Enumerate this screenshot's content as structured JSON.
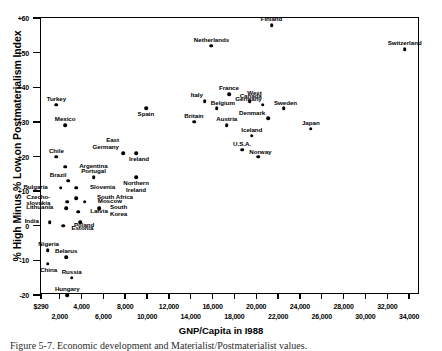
{
  "chart_data": {
    "type": "scatter",
    "title": "",
    "xlabel": "GNP/Capita in I988",
    "ylabel": "% High Minus % Low on Postmaterialism Index",
    "xlim": [
      290,
      35000
    ],
    "ylim": [
      -20,
      60
    ],
    "grid": false,
    "legend": "none",
    "y_ticks": [
      "+60",
      "+50",
      "+40",
      "+30",
      "+20",
      "+10",
      "0",
      "-10",
      "-20"
    ],
    "y_tick_values": [
      60,
      50,
      40,
      30,
      20,
      10,
      0,
      -10,
      -20
    ],
    "x_ticks_upper": [
      "$290",
      "4,000",
      "8,000",
      "12,000",
      "16,000",
      "20,000",
      "24,000",
      "28,000",
      "32,000"
    ],
    "x_ticks_lower": [
      "2,000",
      "6,000",
      "10,000",
      "14,000",
      "18,000",
      "22,000",
      "26,000",
      "30,000",
      "34,000"
    ],
    "x_tick_values_upper": [
      290,
      4000,
      8000,
      12000,
      16000,
      20000,
      24000,
      28000,
      32000
    ],
    "x_tick_values_lower": [
      2000,
      6000,
      10000,
      14000,
      18000,
      22000,
      26000,
      30000,
      34000
    ],
    "points": [
      {
        "label": "Switzerland",
        "x": 33600,
        "y": 51,
        "lx": 0,
        "ly": -9
      },
      {
        "label": "Finland",
        "x": 21400,
        "y": 58,
        "lx": 0,
        "ly": -9
      },
      {
        "label": "Netherlands",
        "x": 15900,
        "y": 52,
        "lx": 0,
        "ly": -9
      },
      {
        "label": "France",
        "x": 17500,
        "y": 38,
        "lx": 0,
        "ly": -9
      },
      {
        "label": "Italy",
        "x": 15300,
        "y": 36,
        "lx": -2,
        "ly": -9
      },
      {
        "label": "Belgium",
        "x": 16400,
        "y": 34,
        "lx": 6,
        "ly": -8
      },
      {
        "label": "Canada",
        "x": 19400,
        "y": 36,
        "lx": 1,
        "ly": -8
      },
      {
        "label": "West\nGermany",
        "x": 20600,
        "y": 35,
        "lx": -1,
        "ly": -15
      },
      {
        "label": "Sweden",
        "x": 22500,
        "y": 34,
        "lx": 2,
        "ly": -8
      },
      {
        "label": "Denmark",
        "x": 21100,
        "y": 31,
        "lx": -3,
        "ly": -8
      },
      {
        "label": "Austria",
        "x": 17300,
        "y": 29,
        "lx": 0,
        "ly": -9
      },
      {
        "label": "Britain",
        "x": 14300,
        "y": 30,
        "lx": 0,
        "ly": -9
      },
      {
        "label": "Spain",
        "x": 9900,
        "y": 34,
        "lx": 0,
        "ly": 3
      },
      {
        "label": "Japan",
        "x": 25000,
        "y": 28,
        "lx": 0,
        "ly": -9
      },
      {
        "label": "Iceland",
        "x": 19600,
        "y": 26,
        "lx": 0,
        "ly": -9
      },
      {
        "label": "U.S.A.",
        "x": 18700,
        "y": 22,
        "lx": 0,
        "ly": -9
      },
      {
        "label": "Norway",
        "x": 20200,
        "y": 20,
        "lx": 2,
        "ly": -8
      },
      {
        "label": "East\nGermany",
        "x": 7800,
        "y": 21,
        "lx": -4,
        "ly": -16
      },
      {
        "label": "Ireland",
        "x": 9000,
        "y": 21,
        "lx": 3,
        "ly": 3
      },
      {
        "label": "Northern\nIreland",
        "x": 9000,
        "y": 14,
        "lx": 0,
        "ly": 3
      },
      {
        "label": "Turkey",
        "x": 1700,
        "y": 35,
        "lx": 0,
        "ly": -9
      },
      {
        "label": "Mexico",
        "x": 2500,
        "y": 29,
        "lx": 0,
        "ly": -9
      },
      {
        "label": "Chile",
        "x": 1700,
        "y": 20,
        "lx": 0,
        "ly": -9
      },
      {
        "label": "Argentina",
        "x": 2500,
        "y": 17,
        "lx": 14,
        "ly": -4
      },
      {
        "label": "Brazil",
        "x": 2800,
        "y": 13,
        "lx": -2,
        "ly": -9
      },
      {
        "label": "Portugal",
        "x": 5100,
        "y": 14,
        "lx": 0,
        "ly": -9
      },
      {
        "label": "Bulgaria",
        "x": 2100,
        "y": 11,
        "lx": -13,
        "ly": -4
      },
      {
        "label": "Slovenia",
        "x": 3500,
        "y": 11,
        "lx": 14,
        "ly": -4
      },
      {
        "label": "South Africa",
        "x": 3500,
        "y": 8,
        "lx": 21,
        "ly": -4
      },
      {
        "label": "Czecho-\nslovakia",
        "x": 2700,
        "y": 7,
        "lx": -17,
        "ly": -8
      },
      {
        "label": "Moscow",
        "x": 4300,
        "y": 7,
        "lx": 13,
        "ly": -4
      },
      {
        "label": "Lithuania",
        "x": 2600,
        "y": 5,
        "lx": -13,
        "ly": -4
      },
      {
        "label": "Latvia",
        "x": 3700,
        "y": 4,
        "lx": 12,
        "ly": -4
      },
      {
        "label": "South\nKorea",
        "x": 5600,
        "y": 5,
        "lx": 11,
        "ly": -4
      },
      {
        "label": "India",
        "x": 1100,
        "y": 1,
        "lx": -11,
        "ly": -4
      },
      {
        "label": "Estonia",
        "x": 3900,
        "y": 1,
        "lx": 2,
        "ly": 3
      },
      {
        "label": "Poland",
        "x": 2300,
        "y": 0,
        "lx": 11,
        "ly": -4
      },
      {
        "label": "Nigeria",
        "x": 900,
        "y": -7,
        "lx": 1,
        "ly": -9
      },
      {
        "label": "Belarus",
        "x": 2600,
        "y": -9,
        "lx": 0,
        "ly": -9
      },
      {
        "label": "China",
        "x": 900,
        "y": -11,
        "lx": 1,
        "ly": 3
      },
      {
        "label": "Russia",
        "x": 3100,
        "y": -15,
        "lx": 0,
        "ly": -9
      },
      {
        "label": "Hungary",
        "x": 2700,
        "y": -20,
        "lx": 0,
        "ly": -9
      }
    ]
  },
  "figure": {
    "caption": "Figure 5-7. Economic development and Materialist/Postmaterialist values."
  }
}
